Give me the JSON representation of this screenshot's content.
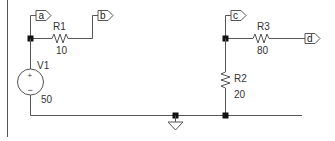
{
  "schematic": {
    "colors": {
      "wire": "#555555",
      "junction": "#111111",
      "text": "#333333",
      "background": "#ffffff"
    },
    "net_flags": [
      {
        "id": "a",
        "label": "a"
      },
      {
        "id": "b",
        "label": "b"
      },
      {
        "id": "c",
        "label": "c"
      },
      {
        "id": "d",
        "label": "d"
      }
    ],
    "components": {
      "R1": {
        "name": "R1",
        "value": "10"
      },
      "R2": {
        "name": "R2",
        "value": "20"
      },
      "R3": {
        "name": "R3",
        "value": "80"
      },
      "V1": {
        "name": "V1",
        "value": "50",
        "plus": "+",
        "minus": "−"
      }
    },
    "ground": {
      "symbol": "ground-icon"
    }
  }
}
